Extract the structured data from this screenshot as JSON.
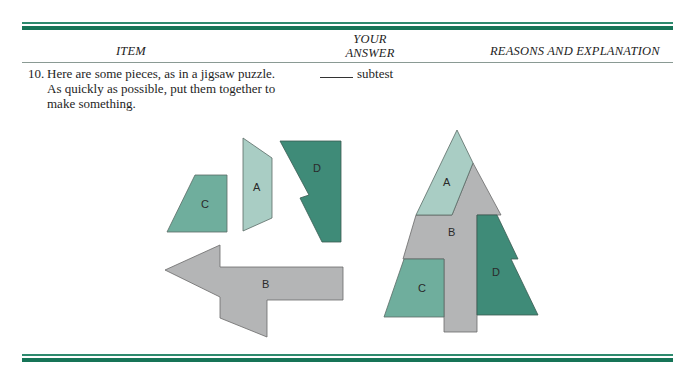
{
  "header": {
    "columns": {
      "item": "ITEM",
      "answer_line1": "YOUR",
      "answer_line2": "ANSWER",
      "reasons": "REASONS AND EXPLANATION"
    }
  },
  "question": {
    "number": "10.",
    "text": "Here are some pieces, as in a jigsaw puzzle. As quickly as possible, put them together to make something.",
    "answer_suffix": "subtest"
  },
  "figure": {
    "colors": {
      "A": "#a9cdc4",
      "B": "#b4b5b6",
      "C": "#6fae9d",
      "D": "#3f8b78",
      "rule": "#167457",
      "stroke": "#5a6b66"
    },
    "loose_pieces": [
      {
        "label": "A"
      },
      {
        "label": "B"
      },
      {
        "label": "C"
      },
      {
        "label": "D"
      }
    ],
    "assembled_tree": [
      {
        "label": "A"
      },
      {
        "label": "B"
      },
      {
        "label": "C"
      },
      {
        "label": "D"
      }
    ]
  }
}
